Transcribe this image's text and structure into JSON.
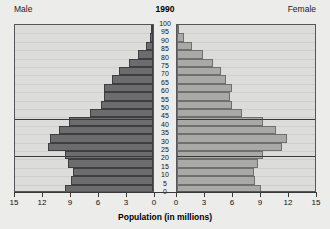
{
  "header": {
    "male_label": "Male",
    "female_label": "Female",
    "year_title": "1990"
  },
  "axis": {
    "x_title": "Population (in millions)",
    "x_ticks_left": [
      "15",
      "12",
      "9",
      "6",
      "3",
      "0"
    ],
    "x_ticks_right": [
      "0",
      "3",
      "6",
      "9",
      "12",
      "15"
    ],
    "age_ticks": [
      "100",
      "95",
      "90",
      "85",
      "80",
      "75",
      "70",
      "65",
      "60",
      "55",
      "50",
      "45",
      "40",
      "35",
      "30",
      "25",
      "20",
      "15",
      "10",
      "5",
      "0"
    ]
  },
  "colors": {
    "male_bar": "#6c6c6e",
    "female_bar": "#a9a9a7",
    "panel_bg": "#dcdcda",
    "page_bg": "#ececea",
    "frame": "#55555a",
    "refline": "#3a3a3c"
  },
  "chart_data": {
    "type": "bar",
    "title": "1990",
    "subtype": "population-pyramid",
    "xlabel": "Population (in millions)",
    "ylabel": "Age",
    "xlim": [
      0,
      15
    ],
    "ylim": [
      0,
      100
    ],
    "grid": true,
    "legend": [
      "Male",
      "Female"
    ],
    "legend_position": "top-left-and-top-right",
    "annotations": [
      {
        "type": "horizontal-reference-line",
        "age": 22
      },
      {
        "type": "horizontal-reference-line",
        "age": 44
      }
    ],
    "categories": [
      "0-4",
      "5-9",
      "10-14",
      "15-19",
      "20-24",
      "25-29",
      "30-34",
      "35-39",
      "40-44",
      "45-49",
      "50-54",
      "55-59",
      "60-64",
      "65-69",
      "70-74",
      "75-79",
      "80-84",
      "85-89",
      "90-94",
      "95-99",
      "100+"
    ],
    "series": [
      {
        "name": "Male",
        "values": [
          9.4,
          8.8,
          8.6,
          9.1,
          9.4,
          11.3,
          11.0,
          10.1,
          9.0,
          6.8,
          5.6,
          5.3,
          5.2,
          4.4,
          3.6,
          2.6,
          1.6,
          0.8,
          0.3,
          0.1,
          0.02
        ]
      },
      {
        "name": "Female",
        "values": [
          9.0,
          8.4,
          8.2,
          8.7,
          9.2,
          11.2,
          11.8,
          10.6,
          9.2,
          7.0,
          5.9,
          5.7,
          5.9,
          5.3,
          4.7,
          3.9,
          2.8,
          1.6,
          0.7,
          0.2,
          0.05
        ]
      }
    ]
  }
}
